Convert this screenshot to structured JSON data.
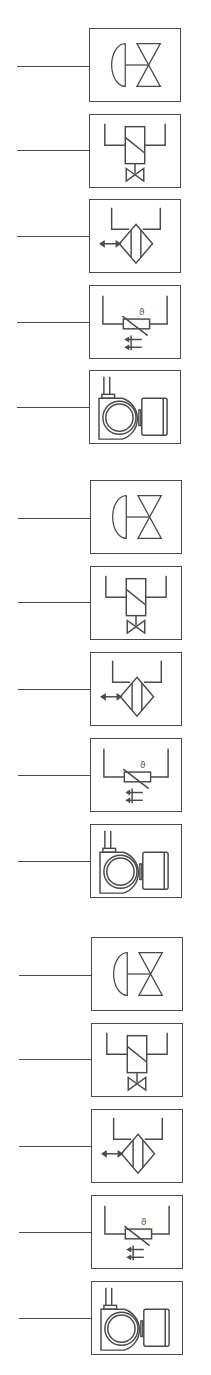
{
  "diagram": {
    "stroke_color": "#4a4a4a",
    "background": "#ffffff",
    "groups": [
      {
        "symbols": [
          {
            "type": "diaphragm-valve",
            "label": "Diaphragm actuated valve"
          },
          {
            "type": "solenoid-valve",
            "label": "Solenoid valve"
          },
          {
            "type": "filter",
            "label": "Filter / heat exchanger"
          },
          {
            "type": "temperature-sensor",
            "label": "Temperature sensor (thermistor)",
            "glyph": "ϑ"
          },
          {
            "type": "pump-motor",
            "label": "Pump with motor"
          }
        ]
      },
      {
        "symbols": [
          {
            "type": "diaphragm-valve",
            "label": "Diaphragm actuated valve"
          },
          {
            "type": "solenoid-valve",
            "label": "Solenoid valve"
          },
          {
            "type": "filter",
            "label": "Filter / heat exchanger"
          },
          {
            "type": "temperature-sensor",
            "label": "Temperature sensor (thermistor)",
            "glyph": "ϑ"
          },
          {
            "type": "pump-motor",
            "label": "Pump with motor"
          }
        ]
      },
      {
        "symbols": [
          {
            "type": "diaphragm-valve",
            "label": "Diaphragm actuated valve"
          },
          {
            "type": "solenoid-valve",
            "label": "Solenoid valve"
          },
          {
            "type": "filter",
            "label": "Filter / heat exchanger"
          },
          {
            "type": "temperature-sensor",
            "label": "Temperature sensor (thermistor)",
            "glyph": "ϑ"
          },
          {
            "type": "pump-motor",
            "label": "Pump with motor"
          }
        ]
      }
    ]
  }
}
